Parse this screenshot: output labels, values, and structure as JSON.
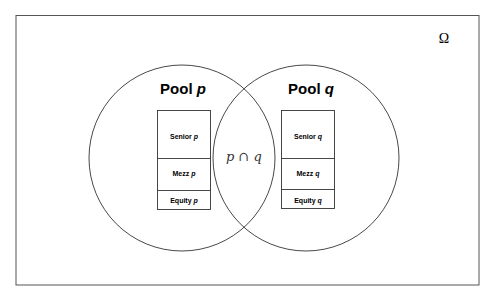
{
  "universe": {
    "label": "Ω"
  },
  "pools": [
    {
      "name": "Pool",
      "var": "p",
      "tranches": [
        {
          "label": "Senior",
          "var": "p"
        },
        {
          "label": "Mezz",
          "var": "p"
        },
        {
          "label": "Equity",
          "var": "p"
        }
      ]
    },
    {
      "name": "Pool",
      "var": "q",
      "tranches": [
        {
          "label": "Senior",
          "var": "q"
        },
        {
          "label": "Mezz",
          "var": "q"
        },
        {
          "label": "Equity",
          "var": "q"
        }
      ]
    }
  ],
  "intersection": {
    "label": "p ∩ q"
  }
}
